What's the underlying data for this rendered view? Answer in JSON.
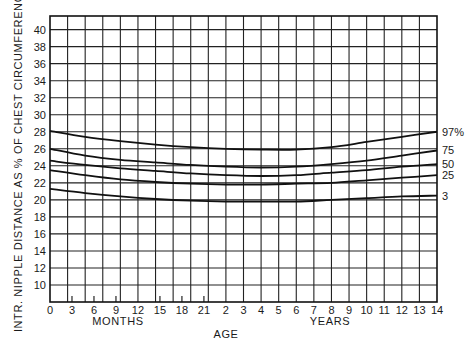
{
  "chart_data": {
    "type": "line",
    "title": "",
    "ylabel": "INTR. NIPPLE DISTANCE AS % OF CHEST CIRCUMFERENCE",
    "xlabel": "AGE",
    "x_sublabels": {
      "months": "MONTHS",
      "years": "YEARS"
    },
    "ylim": [
      8,
      41.6
    ],
    "y_ticks": [
      10,
      12,
      14,
      16,
      18,
      20,
      22,
      24,
      26,
      28,
      30,
      32,
      34,
      36,
      38,
      40
    ],
    "grid": true,
    "x_axis_note": "Grid index 0-22: first 10 intervals span 0-24 months, then one interval per year from 2 to 14 years",
    "x_tick_labels_months": [
      {
        "label": "0",
        "months": 0
      },
      {
        "label": "3",
        "months": 3
      },
      {
        "label": "6",
        "months": 6
      },
      {
        "label": "9",
        "months": 9
      },
      {
        "label": "12",
        "months": 12
      },
      {
        "label": "15",
        "months": 15
      },
      {
        "label": "18",
        "months": 18
      },
      {
        "label": "21",
        "months": 21
      }
    ],
    "x_tick_labels_years": [
      {
        "label": "2",
        "years": 2
      },
      {
        "label": "3",
        "years": 3
      },
      {
        "label": "4",
        "years": 4
      },
      {
        "label": "5",
        "years": 5
      },
      {
        "label": "6",
        "years": 6
      },
      {
        "label": "7",
        "years": 7
      },
      {
        "label": "8",
        "years": 8
      },
      {
        "label": "9",
        "years": 9
      },
      {
        "label": "10",
        "years": 10
      },
      {
        "label": "11",
        "years": 11
      },
      {
        "label": "12",
        "years": 12
      },
      {
        "label": "13",
        "years": 13
      },
      {
        "label": "14",
        "years": 14
      }
    ],
    "x_grid_index": [
      0,
      2,
      4,
      6,
      8,
      10,
      12,
      14,
      16,
      18,
      20,
      22
    ],
    "x_age_at_index": [
      "0 mo",
      "4.8 mo",
      "9.6 mo",
      "14.4 mo",
      "19.2 mo",
      "2 y",
      "4 y",
      "6 y",
      "8 y",
      "10 y",
      "12 y",
      "14 y"
    ],
    "series": [
      {
        "name": "97%",
        "label": "97%",
        "values": [
          28.1,
          27.4,
          26.9,
          26.5,
          26.2,
          26.0,
          25.9,
          25.9,
          26.2,
          26.8,
          27.4,
          28.0
        ]
      },
      {
        "name": "75",
        "label": "75",
        "values": [
          26.0,
          25.2,
          24.7,
          24.4,
          24.1,
          23.9,
          23.8,
          23.9,
          24.2,
          24.6,
          25.2,
          25.8
        ]
      },
      {
        "name": "50",
        "label": "50",
        "values": [
          24.6,
          24.1,
          23.7,
          23.4,
          23.1,
          22.9,
          22.8,
          22.9,
          23.2,
          23.5,
          23.9,
          24.2
        ]
      },
      {
        "name": "25",
        "label": "25",
        "values": [
          23.5,
          22.9,
          22.4,
          22.1,
          21.9,
          21.8,
          21.8,
          21.9,
          22.0,
          22.3,
          22.6,
          22.9
        ]
      },
      {
        "name": "3",
        "label": "3",
        "values": [
          21.3,
          20.8,
          20.4,
          20.1,
          19.9,
          19.8,
          19.8,
          19.8,
          20.0,
          20.2,
          20.4,
          20.5
        ]
      }
    ],
    "legend": "inline labels at right end of curves",
    "colors": {
      "line": "#111111",
      "grid": "#222222",
      "background": "#ffffff"
    }
  }
}
